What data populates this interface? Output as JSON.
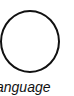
{
  "diagram": {
    "node": {
      "shape": "circle",
      "stroke_color": "#111111",
      "fill_color": "#ffffff",
      "label": "anguage"
    }
  }
}
